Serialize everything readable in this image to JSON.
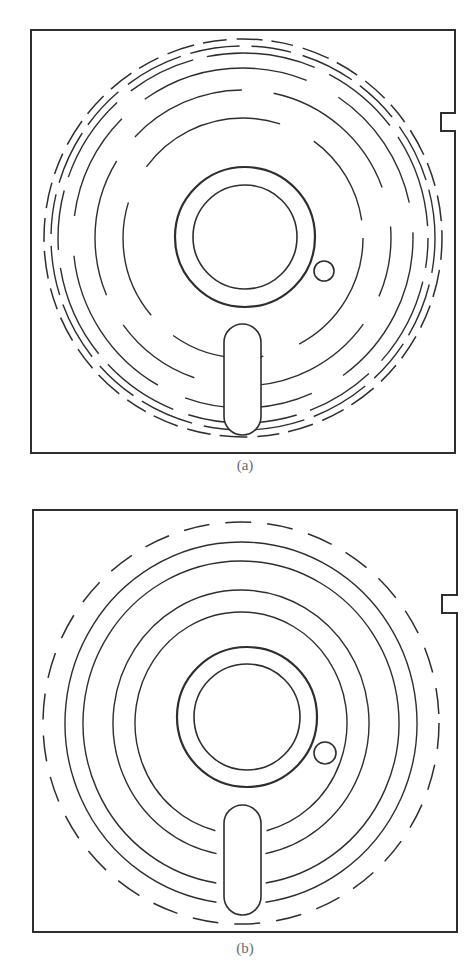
{
  "style": {
    "ink": "#2e2e2e",
    "caption_color": "#6a6a6a",
    "background": "#ffffff"
  },
  "panels": [
    {
      "id": "a",
      "caption": "(a)",
      "caption_pos": [
        215,
        457
      ],
      "jacket": {
        "left": 31,
        "top": 30,
        "right": 455,
        "bottom": 453,
        "notch": {
          "top": 113,
          "bottom": 131,
          "depth_x": 441
        }
      },
      "hub": {
        "cx": 245,
        "cy": 237,
        "outer_r": 70,
        "inner_r": 52
      },
      "index_hole": {
        "cx": 324,
        "cy": 271,
        "r": 10
      },
      "slot": {
        "x": 224,
        "y": 324,
        "w": 37,
        "h": 111
      },
      "track_center": [
        243,
        238
      ],
      "tracks": [
        {
          "r": 120,
          "dash": "150 38 95 30 120 40",
          "offset": 20,
          "width": 1.4
        },
        {
          "r": 148,
          "dash": "120 32 150 40 90 34 140 30",
          "offset": 60,
          "width": 1.4
        },
        {
          "r": 170,
          "dash": "170 36 130 30 160 40 110 30",
          "offset": 10,
          "width": 1.4
        },
        {
          "r": 185,
          "dash": "60 14 90 18 70 14 110 16 80 14 95 18",
          "offset": 30,
          "width": 1.4
        },
        {
          "r": 192,
          "dash": "40 12 55 10 45 12 60 10 50 12",
          "offset": 5,
          "width": 1.4
        },
        {
          "r": 199,
          "dash": "22 10 28 9 24 10 26 9",
          "offset": 0,
          "width": 1.5
        }
      ]
    },
    {
      "id": "b",
      "caption": "(b)",
      "caption_pos": [
        215,
        940
      ],
      "jacket": {
        "left": 33,
        "top": 510,
        "right": 457,
        "bottom": 932,
        "notch": {
          "top": 595,
          "bottom": 613,
          "depth_x": 442
        }
      },
      "hub": {
        "cx": 247,
        "cy": 717,
        "outer_r": 70,
        "inner_r": 53
      },
      "index_hole": {
        "cx": 325,
        "cy": 753,
        "r": 11
      },
      "slot": {
        "x": 224,
        "y": 805,
        "w": 37,
        "h": 110
      },
      "track_center": [
        241,
        723
      ],
      "tracks": [
        {
          "rx": 106,
          "ry": 111,
          "gap_deg": 28,
          "width": 1.4
        },
        {
          "rx": 128,
          "ry": 133,
          "gap_deg": 22,
          "width": 1.4
        },
        {
          "rx": 158,
          "ry": 162,
          "gap_deg": 18,
          "width": 1.4
        },
        {
          "rx": 176,
          "ry": 181,
          "gap_deg": 16,
          "width": 1.4
        }
      ],
      "outer_dashed": {
        "rx": 198,
        "ry": 201,
        "dash": "26 16",
        "width": 1.5
      }
    }
  ]
}
